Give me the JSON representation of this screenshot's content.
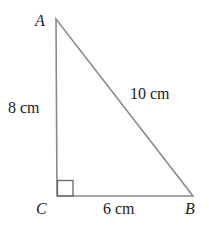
{
  "diagram": {
    "type": "right-triangle",
    "vertices": {
      "A": {
        "label": "A",
        "x": 56,
        "y": 19
      },
      "B": {
        "label": "B",
        "x": 193,
        "y": 196
      },
      "C": {
        "label": "C",
        "x": 57,
        "y": 196
      }
    },
    "right_angle_at": "C",
    "sides": {
      "AC": {
        "label": "8 cm"
      },
      "CB": {
        "label": "6 cm"
      },
      "AB": {
        "label": "10 cm"
      }
    },
    "colors": {
      "stroke": "#888888",
      "text": "#222222"
    }
  }
}
